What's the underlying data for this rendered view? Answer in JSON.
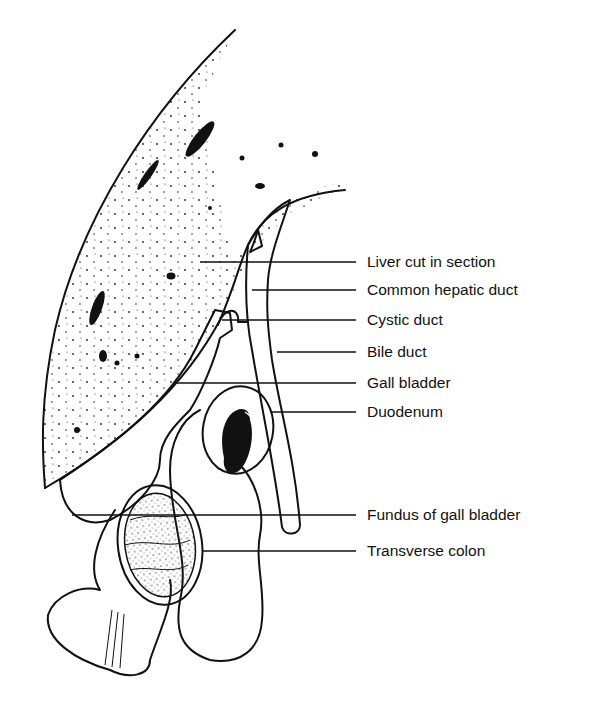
{
  "figure": {
    "colors": {
      "ink": "#111111",
      "shaded": "#bdbdbd",
      "background": "#ffffff"
    }
  },
  "labels": [
    {
      "id": "liver",
      "text": "Liver cut in section",
      "y": 262
    },
    {
      "id": "common-hepatic-duct",
      "text": "Common hepatic duct",
      "y": 290
    },
    {
      "id": "cystic-duct",
      "text": "Cystic duct",
      "y": 320
    },
    {
      "id": "bile-duct",
      "text": "Bile  duct",
      "y": 352
    },
    {
      "id": "gall-bladder",
      "text": "Gall bladder",
      "y": 383
    },
    {
      "id": "duodenum",
      "text": "Duodenum",
      "y": 412
    },
    {
      "id": "fundus",
      "text": "Fundus of gall bladder",
      "y": 515
    },
    {
      "id": "transverse-colon",
      "text": "Transverse colon",
      "y": 551
    }
  ]
}
